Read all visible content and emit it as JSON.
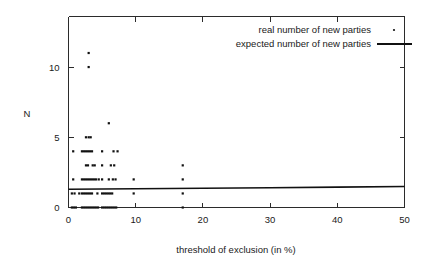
{
  "chart_data": {
    "type": "scatter",
    "title": "",
    "xlabel": "threshold of exclusion (in %)",
    "ylabel": "N",
    "xlim": [
      0,
      50
    ],
    "ylim": [
      0,
      13.6
    ],
    "grid": false,
    "legend_position": "top-right",
    "xticks": [
      0,
      10,
      20,
      30,
      40,
      50
    ],
    "xtick_labels": [
      "0",
      "10",
      "20",
      "30",
      "40",
      "50"
    ],
    "yticks": [
      0,
      5,
      10
    ],
    "ytick_labels": [
      "0",
      "5",
      "10"
    ],
    "series": [
      {
        "name": "real number of new parties",
        "type": "scatter",
        "marker": "dot",
        "points": [
          [
            3.0,
            11
          ],
          [
            3.0,
            10
          ],
          [
            6.0,
            6
          ],
          [
            2.6,
            5
          ],
          [
            3.0,
            5
          ],
          [
            3.3,
            5
          ],
          [
            0.7,
            4
          ],
          [
            2.0,
            4
          ],
          [
            2.3,
            4
          ],
          [
            2.6,
            4
          ],
          [
            2.9,
            4
          ],
          [
            3.2,
            4
          ],
          [
            3.5,
            4
          ],
          [
            5.0,
            4
          ],
          [
            6.7,
            4
          ],
          [
            7.3,
            4
          ],
          [
            2.6,
            3
          ],
          [
            2.9,
            3
          ],
          [
            3.6,
            3
          ],
          [
            3.9,
            3
          ],
          [
            5.0,
            3
          ],
          [
            6.3,
            3
          ],
          [
            6.8,
            3
          ],
          [
            17.0,
            3
          ],
          [
            0.7,
            2
          ],
          [
            2.0,
            2
          ],
          [
            2.3,
            2
          ],
          [
            2.6,
            2
          ],
          [
            2.9,
            2
          ],
          [
            3.2,
            2
          ],
          [
            3.5,
            2
          ],
          [
            3.8,
            2
          ],
          [
            4.1,
            2
          ],
          [
            4.5,
            2
          ],
          [
            5.0,
            2
          ],
          [
            6.0,
            2
          ],
          [
            6.6,
            2
          ],
          [
            7.0,
            2
          ],
          [
            9.7,
            2
          ],
          [
            17.0,
            2
          ],
          [
            0.5,
            1
          ],
          [
            0.9,
            1
          ],
          [
            1.6,
            1
          ],
          [
            2.0,
            1
          ],
          [
            2.3,
            1
          ],
          [
            2.6,
            1
          ],
          [
            2.9,
            1
          ],
          [
            3.2,
            1
          ],
          [
            3.5,
            1
          ],
          [
            4.3,
            1
          ],
          [
            5.0,
            1
          ],
          [
            5.3,
            1
          ],
          [
            5.6,
            1
          ],
          [
            5.9,
            1
          ],
          [
            6.2,
            1
          ],
          [
            6.5,
            1
          ],
          [
            9.7,
            1
          ],
          [
            17.0,
            1
          ],
          [
            0.5,
            0
          ],
          [
            0.8,
            0
          ],
          [
            1.1,
            0
          ],
          [
            2.0,
            0
          ],
          [
            2.3,
            0
          ],
          [
            2.6,
            0
          ],
          [
            2.9,
            0
          ],
          [
            3.2,
            0
          ],
          [
            3.5,
            0
          ],
          [
            3.8,
            0
          ],
          [
            4.1,
            0
          ],
          [
            4.4,
            0
          ],
          [
            5.0,
            0
          ],
          [
            5.3,
            0
          ],
          [
            5.6,
            0
          ],
          [
            5.9,
            0
          ],
          [
            6.2,
            0
          ],
          [
            6.5,
            0
          ],
          [
            6.8,
            0
          ],
          [
            7.1,
            0
          ],
          [
            17.0,
            0
          ]
        ]
      },
      {
        "name": "expected number of new parties",
        "type": "line",
        "marker": "line",
        "points": [
          [
            0.0,
            1.3
          ],
          [
            10.0,
            1.33
          ],
          [
            20.0,
            1.37
          ],
          [
            30.0,
            1.41
          ],
          [
            40.0,
            1.45
          ],
          [
            50.0,
            1.5
          ]
        ]
      }
    ],
    "legend": [
      {
        "label": "real number of new parties",
        "marker": "dot"
      },
      {
        "label": "expected number of new parties",
        "marker": "line"
      }
    ]
  }
}
